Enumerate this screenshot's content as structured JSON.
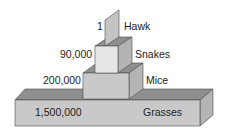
{
  "diagram": {
    "type": "ecological-pyramid-of-numbers",
    "levels": [
      {
        "organism": "Hawk",
        "count": "1"
      },
      {
        "organism": "Snakes",
        "count": "90,000"
      },
      {
        "organism": "Mice",
        "count": "200,000"
      },
      {
        "organism": "Grasses",
        "count": "1,500,000"
      }
    ]
  },
  "colors": {
    "front": "#c9c9c9",
    "top": "#8f8f8f",
    "side": "#b4b4b4",
    "snakes_front": "#e6e6e6",
    "hawk": "#c4c4c4",
    "outline": "#4a4a4a"
  }
}
